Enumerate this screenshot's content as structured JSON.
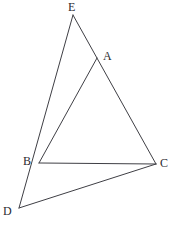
{
  "figure": {
    "background_color": "#ffffff",
    "stroke_color": "#3f3f45",
    "label_color": "#2b2b30",
    "width": 172,
    "height": 228,
    "points": [
      {
        "id": "E",
        "label": "E",
        "x": 73,
        "y": 15,
        "label_x": 68,
        "label_y": 1
      },
      {
        "id": "A",
        "label": "A",
        "x": 97,
        "y": 58,
        "label_x": 103,
        "label_y": 50
      },
      {
        "id": "B",
        "label": "B",
        "x": 39,
        "y": 163,
        "label_x": 23,
        "label_y": 155
      },
      {
        "id": "C",
        "label": "C",
        "x": 156,
        "y": 164,
        "label_x": 160,
        "label_y": 157
      },
      {
        "id": "D",
        "label": "D",
        "x": 19,
        "y": 208,
        "label_x": 3,
        "label_y": 205
      }
    ],
    "segments": [
      {
        "id": "EC",
        "from": "E",
        "to": "C",
        "note": "passes through A"
      },
      {
        "id": "ED",
        "from": "E",
        "to": "D",
        "note": "passes through B"
      },
      {
        "id": "BC",
        "from": "B",
        "to": "C",
        "note": "base of triangle ABC"
      },
      {
        "id": "BA",
        "from": "B",
        "to": "A",
        "note": "cevian from B to A"
      },
      {
        "id": "DC",
        "from": "D",
        "to": "C",
        "note": "base of triangle DBC extension"
      }
    ]
  }
}
